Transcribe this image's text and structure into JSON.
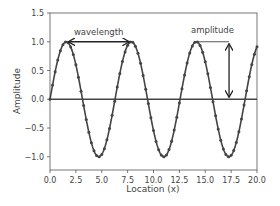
{
  "chart_data": {
    "type": "line",
    "title": "",
    "xlabel": "Location (x)",
    "ylabel": "Amplitude",
    "xlim": [
      0,
      20
    ],
    "ylim": [
      -1.23,
      1.5
    ],
    "xticks": [
      0.0,
      2.5,
      5.0,
      7.5,
      10.0,
      12.5,
      15.0,
      17.5,
      20.0
    ],
    "xtick_labels": [
      "0.0",
      "2.5",
      "5.0",
      "7.5",
      "10.0",
      "12.5",
      "15.0",
      "17.5",
      "20.0"
    ],
    "yticks": [
      -1.0,
      -0.5,
      0.0,
      0.5,
      1.0,
      1.5
    ],
    "ytick_labels": [
      "−1.0",
      "−0.5",
      "0.0",
      "0.5",
      "1.0",
      "1.5"
    ],
    "grid": false,
    "legend": null,
    "series": [
      {
        "name": "sin(x)",
        "function": "y = sin(x)",
        "x_start": 0,
        "x_end": 20,
        "x_step": 0.25,
        "marker": "dot",
        "color": "#444444"
      },
      {
        "name": "baseline",
        "function": "y = 0",
        "color": "#444444"
      }
    ],
    "annotations": [
      {
        "text": "wavelength",
        "type": "double-arrow",
        "x1": 1.5708,
        "x2": 7.854,
        "y": 1.0,
        "text_x": 4.7,
        "text_y": 1.12
      },
      {
        "text": "amplitude",
        "type": "double-arrow-vertical",
        "x": 17.3,
        "y1": 1.0,
        "y2": 0.0,
        "text_x": 15.7,
        "text_y": 1.15,
        "guide_from_x": 14.137
      }
    ],
    "colors": {
      "line": "#444444",
      "axis": "#555555",
      "text": "#444444"
    }
  }
}
